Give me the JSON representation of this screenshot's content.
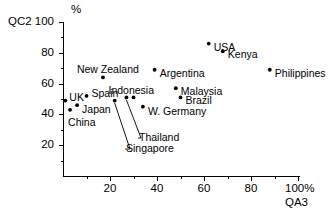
{
  "chart_data": {
    "type": "scatter",
    "title": "",
    "xlabel": "QA3",
    "ylabel": "QC2",
    "x_unit": "%",
    "y_unit": "%",
    "xlim": [
      0,
      100
    ],
    "ylim": [
      0,
      100
    ],
    "xticks": [
      20,
      40,
      60,
      80,
      100
    ],
    "yticks": [
      20,
      40,
      60,
      80,
      100
    ],
    "xtick_labels": [
      "20",
      "40",
      "60",
      "80",
      "100"
    ],
    "ytick_labels": [
      "20",
      "40",
      "60",
      "80",
      "100"
    ],
    "grid": false,
    "legend": false,
    "x_axis_end_label": "100%",
    "points": [
      {
        "label": "UK",
        "x": 1,
        "y": 49,
        "label_dx": 4,
        "label_dy": -4,
        "anchor": "start",
        "leader": false
      },
      {
        "label": "China",
        "x": 3,
        "y": 43,
        "label_dx": -2,
        "label_dy": 12,
        "anchor": "start",
        "leader": false
      },
      {
        "label": "Japan",
        "x": 6,
        "y": 46,
        "label_dx": 5,
        "label_dy": 4,
        "anchor": "start",
        "leader": false
      },
      {
        "label": "Spain",
        "x": 10,
        "y": 52,
        "label_dx": 5,
        "label_dy": -3,
        "anchor": "start",
        "leader": false
      },
      {
        "label": "New Zealand",
        "x": 17,
        "y": 64,
        "label_dx": -26,
        "label_dy": -8,
        "anchor": "start",
        "leader": false
      },
      {
        "label": "Singapore",
        "x": 22,
        "y": 49,
        "label_dx": 0,
        "label_dy": 0,
        "anchor": "start",
        "leader": true
      },
      {
        "label": "Thailand",
        "x": 27,
        "y": 51,
        "label_dx": 0,
        "label_dy": 0,
        "anchor": "start",
        "leader": true
      },
      {
        "label": "Indonesia",
        "x": 30,
        "y": 51,
        "label_dx": -25,
        "label_dy": -7,
        "anchor": "start",
        "leader": false
      },
      {
        "label": "W. Germany",
        "x": 34,
        "y": 45,
        "label_dx": 5,
        "label_dy": 4,
        "anchor": "start",
        "leader": false
      },
      {
        "label": "Argentina",
        "x": 39,
        "y": 69,
        "label_dx": 5,
        "label_dy": 3,
        "anchor": "start",
        "leader": false
      },
      {
        "label": "Malaysia",
        "x": 48,
        "y": 57,
        "label_dx": 5,
        "label_dy": 3,
        "anchor": "start",
        "leader": false
      },
      {
        "label": "Brazil",
        "x": 50,
        "y": 51,
        "label_dx": 5,
        "label_dy": 3,
        "anchor": "start",
        "leader": false
      },
      {
        "label": "USA",
        "x": 62,
        "y": 86,
        "label_dx": 5,
        "label_dy": 3,
        "anchor": "start",
        "leader": false
      },
      {
        "label": "Kenya",
        "x": 68,
        "y": 81,
        "label_dx": 5,
        "label_dy": 3,
        "anchor": "start",
        "leader": false
      },
      {
        "label": "Philippines",
        "x": 88,
        "y": 69,
        "label_dx": 5,
        "label_dy": 3,
        "anchor": "start",
        "leader": false
      }
    ]
  },
  "axes": {
    "y_axis_title": "QC2",
    "y_axis_unit": "%",
    "x_axis_title": "QA3",
    "x_axis_end": "100%"
  },
  "colors": {
    "ink": "#000000",
    "background": "#ffffff"
  }
}
